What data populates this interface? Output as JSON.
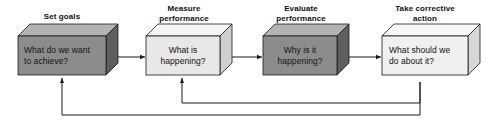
{
  "diagram": {
    "type": "process-flow",
    "orientation": "left-to-right",
    "background_color": "#ffffff",
    "line_color": "#1a1a1a",
    "text_color": "#111111",
    "box_style": "3d-extruded-block",
    "steps": [
      {
        "id": "set-goals",
        "title": "Set goals",
        "question": "What do we want\nto achieve?",
        "fill": "#8c8c8c",
        "fill_top": "#b3b3b3",
        "fill_side": "#5e5e5e",
        "shade": "dark",
        "x": 18,
        "y": 36,
        "width": 88,
        "height": 39,
        "title_x": 18,
        "title_y": 12,
        "title_width": 88
      },
      {
        "id": "measure-performance",
        "title": "Measure\nperformance",
        "question": "What is\nhappening?",
        "fill": "#e8e8e8",
        "fill_top": "#f4f4f4",
        "fill_side": "#cfcfcf",
        "shade": "light",
        "x": 146,
        "y": 36,
        "width": 74,
        "height": 39,
        "title_x": 142,
        "title_y": 4,
        "title_width": 84
      },
      {
        "id": "evaluate-performance",
        "title": "Evaluate\nperformance",
        "question": "Why is it\nhappening?",
        "fill": "#8c8c8c",
        "fill_top": "#b3b3b3",
        "fill_side": "#5e5e5e",
        "shade": "dark",
        "x": 263,
        "y": 36,
        "width": 74,
        "height": 39,
        "title_x": 259,
        "title_y": 4,
        "title_width": 84
      },
      {
        "id": "take-corrective-action",
        "title": "Take corrective\naction",
        "question": "What should we\ndo about it?",
        "fill": "#f0f0f0",
        "fill_top": "#f8f8f8",
        "fill_side": "#d6d6d6",
        "shade": "light",
        "x": 382,
        "y": 36,
        "width": 86,
        "height": 39,
        "title_x": 376,
        "title_y": 4,
        "title_width": 98
      }
    ],
    "connectors": [
      {
        "id": "arrow-1-to-2",
        "from": "set-goals",
        "to": "measure-performance"
      },
      {
        "id": "arrow-2-to-3",
        "from": "measure-performance",
        "to": "evaluate-performance"
      },
      {
        "id": "arrow-3-to-4",
        "from": "evaluate-performance",
        "to": "take-corrective-action"
      }
    ],
    "feedback_loops": [
      {
        "id": "feedback-outer",
        "from": "take-corrective-action",
        "to": "set-goals",
        "route_y": 115
      },
      {
        "id": "feedback-inner",
        "from": "take-corrective-action",
        "to": "measure-performance",
        "route_y": 103
      }
    ]
  }
}
